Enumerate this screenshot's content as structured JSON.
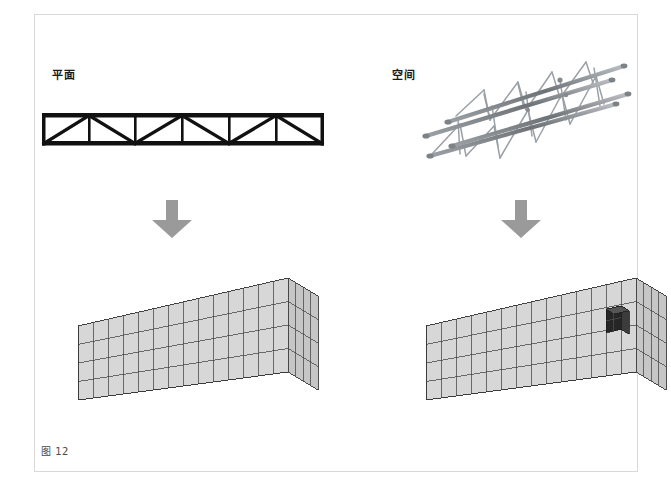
{
  "page": {
    "caption": "图 12",
    "background_color": "#ffffff",
    "border_color": "#d8d8d8"
  },
  "columns": [
    {
      "id": "plane",
      "label": "平面",
      "top_figure": "plane-truss-elevation",
      "arrow": "down-arrow",
      "bottom_figure": "plane-truss-grid-box"
    },
    {
      "id": "space",
      "label": "空间",
      "top_figure": "space-truss-photo",
      "arrow": "down-arrow",
      "bottom_figure": "space-truss-grid-box"
    }
  ],
  "arrows": {
    "direction": "down",
    "color": "#9a9a9a",
    "count": 2
  },
  "plane_truss": {
    "type": "warren-pratt-truss-elevation",
    "panels": 6,
    "chord_color": "#111111",
    "diagonal_color": "#111111",
    "width": 280,
    "height": 42
  },
  "space_truss": {
    "type": "square-space-truss-photo",
    "orientation": "diagonal",
    "member_color": "#8d9094"
  },
  "grid_boxes": [
    {
      "id": "left",
      "type": "isometric-wireframe-box",
      "cells_long": 14,
      "cells_short": 4,
      "cells_tall": 4,
      "line_color": "#3a3a3a",
      "face_fill": "#d7d7d7",
      "highlight_cell": null
    },
    {
      "id": "right",
      "type": "isometric-wireframe-box",
      "cells_long": 14,
      "cells_short": 4,
      "cells_tall": 4,
      "line_color": "#3a3a3a",
      "face_fill": "#d7d7d7",
      "highlight_cell": {
        "color": "#2a2a2a",
        "position": "front-face-right-upper"
      }
    }
  ]
}
